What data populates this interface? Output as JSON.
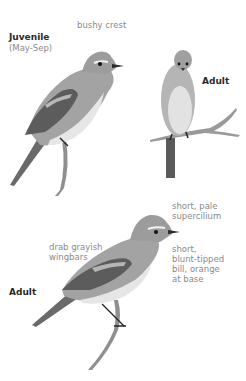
{
  "figure": {
    "panels": [
      {
        "id": "juvenile",
        "title": "Juvenile",
        "subtitle": "(May-Sep)",
        "annotations": [
          "bushy crest"
        ]
      },
      {
        "id": "adult-front",
        "title": "Adult",
        "annotations": []
      },
      {
        "id": "adult-side",
        "title": "Adult",
        "annotations": [
          "short, pale",
          "supercilium",
          "drab grayish",
          "wingbars",
          "short,",
          "blunt-tipped",
          "bill, orange",
          "at base"
        ]
      }
    ],
    "colors": {
      "background": "#ffffff",
      "bird_body": "#9a9a9a",
      "bird_belly": "#e4e4e4",
      "wing": "#5a5a5a",
      "branch": "#8a8a8a",
      "label_bold": "#2a2a2a",
      "label_note": "#8a8a8a"
    }
  }
}
